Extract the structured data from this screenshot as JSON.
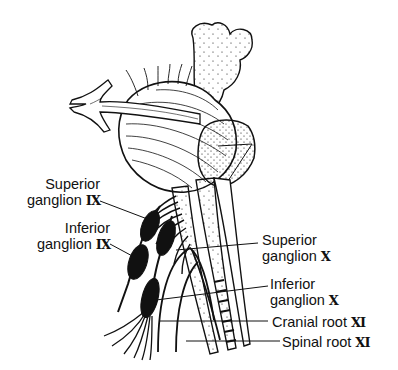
{
  "figure": {
    "labels": [
      {
        "id": "superior_ganglion_ix",
        "line1": "Superior",
        "line2": "ganglion",
        "numeral": "IX"
      },
      {
        "id": "inferior_ganglion_ix",
        "line1": "Inferior",
        "line2": "ganglion",
        "numeral": "IX"
      },
      {
        "id": "superior_ganglion_x",
        "line1": "Superior",
        "line2": "ganglion",
        "numeral": "X"
      },
      {
        "id": "inferior_ganglion_x",
        "line1": "Inferior",
        "line2": "ganglion",
        "numeral": "X"
      },
      {
        "id": "cranial_root_xi",
        "line1": "Cranial root",
        "numeral": "XI"
      },
      {
        "id": "spinal_root_xi",
        "line1": "Spinal root",
        "numeral": "XI"
      }
    ],
    "colors": {
      "ink": "#111111",
      "background": "#ffffff"
    }
  }
}
